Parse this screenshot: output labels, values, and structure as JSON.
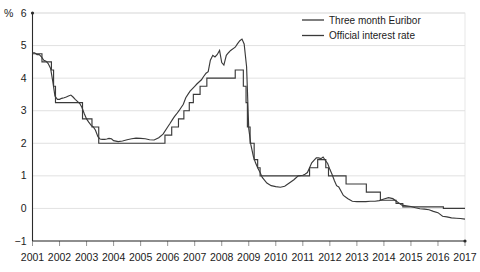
{
  "chart_data": {
    "type": "line",
    "title": "",
    "subtitle": "",
    "xlabel": "",
    "ylabel": "%",
    "unit_label": "%",
    "xlim": [
      2001,
      2017
    ],
    "ylim": [
      -1,
      6
    ],
    "ytick_labels": [
      "6",
      "5",
      "4",
      "3",
      "2",
      "1",
      "0",
      "-1"
    ],
    "ytick_values": [
      6,
      5,
      4,
      3,
      2,
      1,
      0,
      -1
    ],
    "xtick_labels": [
      "2001",
      "2002",
      "2003",
      "2004",
      "2005",
      "2006",
      "2007",
      "2008",
      "2009",
      "2010",
      "2011",
      "2012",
      "2013",
      "2014",
      "2015",
      "2016",
      "2017"
    ],
    "xtick_values": [
      2001,
      2002,
      2003,
      2004,
      2005,
      2006,
      2007,
      2008,
      2009,
      2010,
      2011,
      2012,
      2013,
      2014,
      2015,
      2016,
      2017
    ],
    "grid": true,
    "grid_axis": "y",
    "legend_position": "top-right",
    "legend": [
      "Three month Euribor",
      "Official interest rate"
    ],
    "colors": {
      "series_line": "#3a3a3a",
      "gridline": "#d9d9d9",
      "axis": "#2b2b2b",
      "frame": "#e2e2e2",
      "text": "#1b1b1b",
      "background": "#ffffff"
    },
    "series": [
      {
        "name": "Three month Euribor",
        "color": "#3a3a3a",
        "x": [
          2001.0,
          2001.08,
          2001.17,
          2001.25,
          2001.33,
          2001.42,
          2001.5,
          2001.58,
          2001.67,
          2001.75,
          2001.83,
          2001.92,
          2002.0,
          2002.08,
          2002.17,
          2002.25,
          2002.33,
          2002.42,
          2002.5,
          2002.58,
          2002.67,
          2002.75,
          2002.83,
          2002.92,
          2003.0,
          2003.08,
          2003.17,
          2003.25,
          2003.33,
          2003.42,
          2003.5,
          2003.58,
          2003.67,
          2003.75,
          2003.83,
          2003.92,
          2004.0,
          2004.17,
          2004.33,
          2004.5,
          2004.67,
          2004.83,
          2005.0,
          2005.17,
          2005.33,
          2005.5,
          2005.67,
          2005.83,
          2006.0,
          2006.08,
          2006.17,
          2006.25,
          2006.33,
          2006.42,
          2006.5,
          2006.58,
          2006.67,
          2006.75,
          2006.83,
          2006.92,
          2007.0,
          2007.08,
          2007.17,
          2007.25,
          2007.33,
          2007.42,
          2007.5,
          2007.58,
          2007.67,
          2007.75,
          2007.83,
          2007.92,
          2008.0,
          2008.08,
          2008.17,
          2008.25,
          2008.33,
          2008.5,
          2008.58,
          2008.67,
          2008.75,
          2008.83,
          2008.92,
          2009.0,
          2009.08,
          2009.17,
          2009.25,
          2009.33,
          2009.42,
          2009.5,
          2009.67,
          2009.83,
          2010.0,
          2010.17,
          2010.33,
          2010.5,
          2010.67,
          2010.83,
          2011.0,
          2011.08,
          2011.17,
          2011.25,
          2011.33,
          2011.42,
          2011.5,
          2011.58,
          2011.67,
          2011.75,
          2011.83,
          2011.92,
          2012.0,
          2012.08,
          2012.17,
          2012.25,
          2012.33,
          2012.5,
          2012.67,
          2012.83,
          2013.0,
          2013.17,
          2013.33,
          2013.5,
          2013.67,
          2013.83,
          2014.0,
          2014.17,
          2014.33,
          2014.5,
          2014.67,
          2014.83,
          2015.0,
          2015.17,
          2015.33,
          2015.5,
          2015.67,
          2015.83,
          2016.0,
          2016.17,
          2016.33,
          2016.5,
          2016.67,
          2016.83,
          2017.0
        ],
        "y": [
          4.78,
          4.78,
          4.72,
          4.72,
          4.65,
          4.55,
          4.52,
          4.45,
          4.3,
          3.9,
          3.45,
          3.35,
          3.35,
          3.38,
          3.4,
          3.42,
          3.45,
          3.48,
          3.42,
          3.35,
          3.28,
          3.22,
          3.1,
          2.9,
          2.75,
          2.65,
          2.55,
          2.5,
          2.4,
          2.2,
          2.13,
          2.12,
          2.12,
          2.13,
          2.15,
          2.14,
          2.08,
          2.05,
          2.07,
          2.11,
          2.14,
          2.16,
          2.15,
          2.14,
          2.11,
          2.1,
          2.17,
          2.28,
          2.5,
          2.6,
          2.72,
          2.82,
          2.9,
          3.0,
          3.1,
          3.2,
          3.4,
          3.5,
          3.6,
          3.68,
          3.75,
          3.82,
          3.89,
          3.95,
          4.05,
          4.15,
          4.2,
          4.55,
          4.7,
          4.65,
          4.72,
          4.85,
          4.48,
          4.4,
          4.7,
          4.78,
          4.85,
          4.95,
          5.05,
          5.15,
          5.2,
          5.05,
          4.35,
          2.45,
          1.95,
          1.6,
          1.4,
          1.25,
          1.1,
          0.95,
          0.78,
          0.7,
          0.67,
          0.65,
          0.68,
          0.78,
          0.88,
          1.0,
          1.02,
          1.05,
          1.1,
          1.25,
          1.4,
          1.48,
          1.55,
          1.55,
          1.53,
          1.58,
          1.48,
          1.38,
          1.2,
          1.05,
          0.85,
          0.7,
          0.66,
          0.4,
          0.3,
          0.22,
          0.21,
          0.21,
          0.21,
          0.22,
          0.22,
          0.24,
          0.29,
          0.33,
          0.3,
          0.2,
          0.1,
          0.08,
          0.06,
          0.02,
          -0.01,
          -0.02,
          -0.04,
          -0.09,
          -0.13,
          -0.24,
          -0.26,
          -0.29,
          -0.3,
          -0.31,
          -0.33
        ]
      },
      {
        "name": "Official interest rate",
        "color": "#3a3a3a",
        "x": [
          2001.0,
          2001.35,
          2001.35,
          2001.7,
          2001.7,
          2001.78,
          2001.78,
          2001.85,
          2001.85,
          2002.85,
          2002.85,
          2003.2,
          2003.2,
          2003.45,
          2003.45,
          2005.9,
          2005.9,
          2006.15,
          2006.15,
          2006.4,
          2006.4,
          2006.6,
          2006.6,
          2006.8,
          2006.8,
          2006.95,
          2006.95,
          2007.2,
          2007.2,
          2007.45,
          2007.45,
          2008.5,
          2008.5,
          2008.8,
          2008.8,
          2008.9,
          2008.9,
          2008.95,
          2008.95,
          2009.05,
          2009.05,
          2009.2,
          2009.2,
          2009.33,
          2009.33,
          2009.42,
          2009.42,
          2011.25,
          2011.25,
          2011.55,
          2011.55,
          2011.85,
          2011.85,
          2011.95,
          2011.95,
          2012.6,
          2012.6,
          2013.35,
          2013.35,
          2013.87,
          2013.87,
          2014.45,
          2014.45,
          2014.7,
          2014.7,
          2016.2,
          2016.2,
          2017.0
        ],
        "y": [
          4.75,
          4.75,
          4.5,
          4.5,
          4.25,
          4.25,
          3.75,
          3.75,
          3.25,
          3.25,
          2.75,
          2.75,
          2.5,
          2.5,
          2.0,
          2.0,
          2.25,
          2.25,
          2.5,
          2.5,
          2.75,
          2.75,
          3.0,
          3.0,
          3.25,
          3.25,
          3.5,
          3.5,
          3.75,
          3.75,
          4.0,
          4.0,
          4.25,
          4.25,
          3.75,
          3.75,
          3.25,
          3.25,
          2.5,
          2.5,
          2.0,
          2.0,
          1.5,
          1.5,
          1.25,
          1.25,
          1.0,
          1.0,
          1.25,
          1.25,
          1.5,
          1.5,
          1.25,
          1.25,
          1.0,
          1.0,
          0.75,
          0.75,
          0.5,
          0.5,
          0.25,
          0.25,
          0.15,
          0.15,
          0.05,
          0.05,
          0.0,
          0.0
        ]
      }
    ],
    "annotations": []
  }
}
